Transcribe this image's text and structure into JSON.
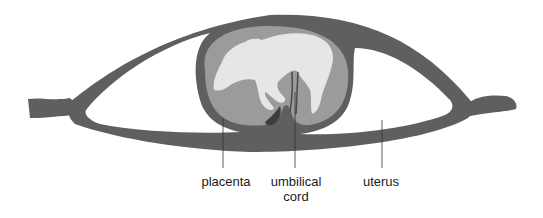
{
  "diagram": {
    "labels": [
      {
        "id": "placenta",
        "text": "placenta"
      },
      {
        "id": "umbilical_cord",
        "text": "umbilical\ncord",
        "line1": "umbilical",
        "line2": "cord"
      },
      {
        "id": "uterus",
        "text": "uterus"
      }
    ],
    "colors": {
      "uterus_wall": "#5f5f5f",
      "amniotic_fill": "#9b9b9b",
      "fetus": "#e6e6e6",
      "placenta_dark": "#3e3e3e",
      "leader_line": "#333333",
      "background": "#ffffff"
    }
  }
}
